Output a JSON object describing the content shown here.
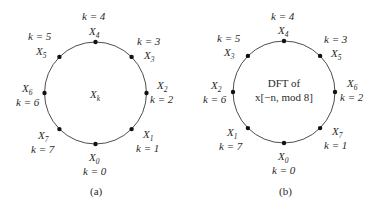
{
  "diagrams": [
    {
      "id": "a",
      "caption": "(a)",
      "center_label": {
        "symbol": "X",
        "subscript": "k"
      },
      "center_lines": [],
      "points": [
        {
          "k": "k = 0",
          "X": "X",
          "sub": "0"
        },
        {
          "k": "k = 1",
          "X": "X",
          "sub": "1"
        },
        {
          "k": "k = 2",
          "X": "X",
          "sub": "2"
        },
        {
          "k": "k = 3",
          "X": "X",
          "sub": "3"
        },
        {
          "k": "k = 4",
          "X": "X",
          "sub": "4"
        },
        {
          "k": "k = 5",
          "X": "X",
          "sub": "5"
        },
        {
          "k": "k = 6",
          "X": "X",
          "sub": "6"
        },
        {
          "k": "k = 7",
          "X": "X",
          "sub": "7"
        }
      ]
    },
    {
      "id": "b",
      "caption": "(b)",
      "center_lines": [
        "DFT of",
        "x[−n, mod 8]"
      ],
      "points": [
        {
          "k": "k = 0",
          "X": "X",
          "sub": "0"
        },
        {
          "k": "k = 1",
          "X": "X",
          "sub": "7"
        },
        {
          "k": "k = 2",
          "X": "X",
          "sub": "6"
        },
        {
          "k": "k = 3",
          "X": "X",
          "sub": "5"
        },
        {
          "k": "k = 4",
          "X": "X",
          "sub": "4"
        },
        {
          "k": "k = 5",
          "X": "X",
          "sub": "3"
        },
        {
          "k": "k = 6",
          "X": "X",
          "sub": "2"
        },
        {
          "k": "k = 7",
          "X": "X",
          "sub": "1"
        }
      ]
    }
  ],
  "colors": {
    "line": "#3a3a3a",
    "dot": "#111111",
    "text": "#2a2a2a"
  }
}
